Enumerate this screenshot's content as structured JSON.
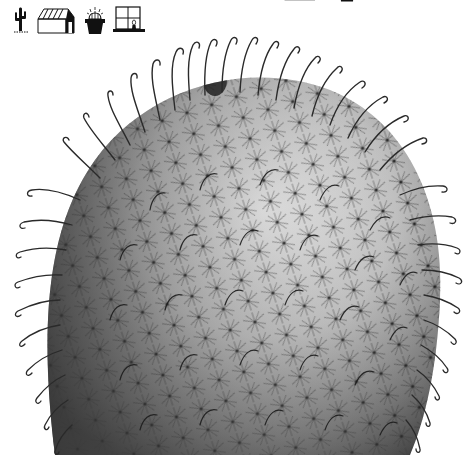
{
  "image": {
    "subject": "hooked-spine cactus (grayscale photograph)",
    "background": "#ffffff",
    "tone": "grayscale"
  },
  "icons_top_left": [
    {
      "name": "cactus-icon",
      "desc": "saguaro cactus silhouette"
    },
    {
      "name": "greenhouse-icon",
      "desc": "greenhouse outline"
    },
    {
      "name": "potted-cactus-icon",
      "desc": "spiny cactus in pot"
    },
    {
      "name": "window-plant-icon",
      "desc": "window with plant on sill"
    }
  ],
  "icons_top_clipped": [
    {
      "name": "cactus-icon"
    },
    {
      "name": "greenhouse-icon"
    },
    {
      "name": "potted-cactus-icon"
    },
    {
      "name": "window-plant-icon"
    }
  ],
  "colors": {
    "ink": "#111111",
    "spine": "#2a2a2a",
    "body_dark": "#4a4a4a",
    "body_mid": "#8a8a8a",
    "body_light": "#d8d8d8"
  }
}
